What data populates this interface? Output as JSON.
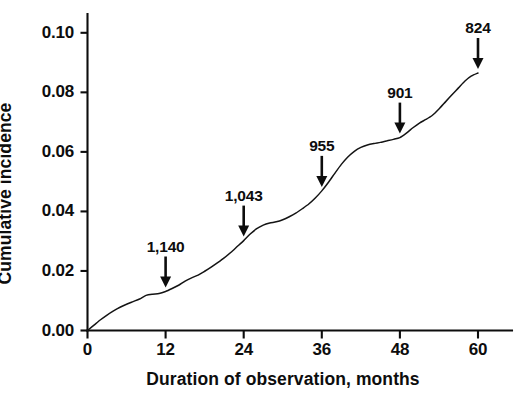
{
  "chart_data": {
    "type": "line",
    "title": "",
    "subtitle": "",
    "xlabel": "Duration of  observation, months",
    "ylabel": "Cumulative incidence",
    "xlim": [
      0,
      63
    ],
    "ylim": [
      0.0,
      0.108
    ],
    "xticks": [
      0,
      12,
      24,
      36,
      48,
      60
    ],
    "xticklabels": [
      "0",
      "12",
      "24",
      "36",
      "48",
      "60"
    ],
    "yticks": [
      0.0,
      0.02,
      0.04,
      0.06,
      0.08,
      0.1
    ],
    "yticklabels": [
      "0.00",
      "0.02",
      "0.04",
      "0.06",
      "0.08",
      "0.10"
    ],
    "grid": false,
    "legend": null,
    "series": [
      {
        "name": "Cumulative incidence",
        "x": [
          0,
          1,
          2,
          3,
          4,
          5,
          6,
          7,
          8,
          9,
          10,
          11,
          12,
          13,
          14,
          15,
          16,
          17,
          18,
          19,
          20,
          21,
          22,
          23,
          24,
          25,
          26,
          27,
          28,
          29,
          30,
          31,
          32,
          33,
          34,
          35,
          36,
          37,
          38,
          39,
          40,
          41,
          42,
          43,
          44,
          45,
          46,
          47,
          48,
          49,
          50,
          51,
          52,
          53,
          54,
          55,
          56,
          57,
          58,
          59,
          60
        ],
        "values": [
          0.0,
          0.0018,
          0.0036,
          0.0052,
          0.0066,
          0.0078,
          0.0088,
          0.0097,
          0.0106,
          0.0118,
          0.0122,
          0.0124,
          0.0131,
          0.0141,
          0.0152,
          0.0166,
          0.0177,
          0.0186,
          0.0199,
          0.0213,
          0.0228,
          0.0244,
          0.0262,
          0.0282,
          0.0302,
          0.0324,
          0.0342,
          0.0354,
          0.0361,
          0.0365,
          0.0372,
          0.0382,
          0.0394,
          0.0409,
          0.0425,
          0.0445,
          0.0469,
          0.0497,
          0.0528,
          0.0558,
          0.0583,
          0.0602,
          0.0615,
          0.0623,
          0.0628,
          0.0632,
          0.0637,
          0.0642,
          0.0648,
          0.0663,
          0.0681,
          0.0697,
          0.0709,
          0.0723,
          0.0744,
          0.0768,
          0.0792,
          0.0815,
          0.0838,
          0.0855,
          0.0865
        ]
      }
    ],
    "annotations": [
      {
        "label": "1,140",
        "x": 12,
        "y": 0.0131,
        "kind": "down-arrow",
        "meaning": "number-at-risk"
      },
      {
        "label": "1,043",
        "x": 24,
        "y": 0.0302,
        "kind": "down-arrow",
        "meaning": "number-at-risk"
      },
      {
        "label": "955",
        "x": 36,
        "y": 0.0469,
        "kind": "down-arrow",
        "meaning": "number-at-risk"
      },
      {
        "label": "901",
        "x": 48,
        "y": 0.0648,
        "kind": "down-arrow",
        "meaning": "number-at-risk"
      },
      {
        "label": "824",
        "x": 60,
        "y": 0.0865,
        "kind": "down-arrow",
        "meaning": "number-at-risk"
      }
    ]
  },
  "colors": {
    "axis": "#0d0d0d",
    "curve": "#141414",
    "annotation": "#0d0d0d",
    "background": "#ffffff"
  }
}
